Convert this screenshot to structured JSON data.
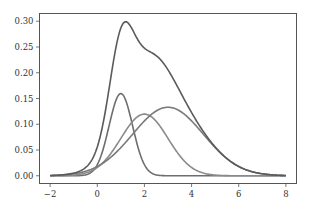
{
  "chart_data": {
    "type": "line",
    "title": "",
    "xlabel": "",
    "ylabel": "",
    "xlim": [
      -2.45,
      8.45
    ],
    "ylim": [
      -0.015,
      0.315
    ],
    "grid": false,
    "legend": null,
    "x_ticks": [
      -2,
      0,
      2,
      4,
      6,
      8
    ],
    "x_tick_labels": [
      "−2",
      "0",
      "2",
      "4",
      "6",
      "8"
    ],
    "y_ticks": [
      0.0,
      0.05,
      0.1,
      0.15,
      0.2,
      0.25,
      0.3
    ],
    "y_tick_labels": [
      "0.00",
      "0.05",
      "0.10",
      "0.15",
      "0.20",
      "0.25",
      "0.30"
    ],
    "x_range": [
      -2,
      8
    ],
    "series": [
      {
        "name": "component-1",
        "kind": "gaussian",
        "weight": 0.2,
        "mean": 1.0,
        "sd": 0.5,
        "peak": 0.16,
        "color": "#6e6e6e"
      },
      {
        "name": "component-2",
        "kind": "gaussian",
        "weight": 0.3,
        "mean": 2.0,
        "sd": 1.0,
        "peak": 0.12,
        "color": "#8a8a8a"
      },
      {
        "name": "component-3",
        "kind": "gaussian",
        "weight": 0.5,
        "mean": 3.0,
        "sd": 1.5,
        "peak": 0.133,
        "color": "#7a7a7a"
      },
      {
        "name": "mixture-sum",
        "kind": "sum",
        "peak": 0.3,
        "peak_x": 1.15,
        "color": "#5a5a5a"
      }
    ]
  }
}
